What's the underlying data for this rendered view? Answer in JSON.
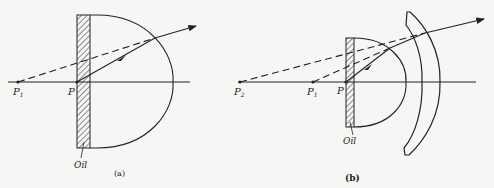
{
  "figure": {
    "panels": [
      {
        "id": "a",
        "caption": "(a)",
        "labels": {
          "p1": "P",
          "p1_sub": "1",
          "p": "P",
          "oil": "Oil"
        }
      },
      {
        "id": "b",
        "caption": "(b)",
        "labels": {
          "p2": "P",
          "p2_sub": "2",
          "p1": "P",
          "p1_sub": "1",
          "p": "P",
          "oil": "Oil"
        }
      }
    ],
    "colors": {
      "ink": "#222222",
      "background": "#f6f6f4"
    }
  }
}
